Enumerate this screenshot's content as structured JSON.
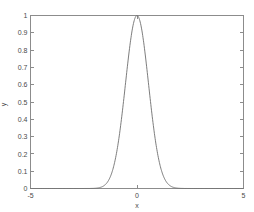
{
  "figure": {
    "background_color": "#ffffff",
    "axis_color": "#8c8c8c",
    "curve_color": "#6e6e6e",
    "text_color": "#4a4a4a"
  },
  "axes": {
    "x_title": "x",
    "y_title": "y",
    "x_tick_labels": [
      "-5",
      "0",
      "5"
    ],
    "y_tick_labels": [
      "0",
      "0.1",
      "0.2",
      "0.3",
      "0.4",
      "0.5",
      "0.6",
      "0.7",
      "0.8",
      "0.9",
      "1"
    ]
  },
  "chart_data": {
    "type": "line",
    "title": "",
    "xlabel": "x",
    "ylabel": "y",
    "xlim": [
      -5,
      5
    ],
    "ylim": [
      0,
      1
    ],
    "grid": false,
    "legend": null,
    "x_ticks": [
      -5,
      0,
      5
    ],
    "y_ticks": [
      0,
      0.1,
      0.2,
      0.3,
      0.4,
      0.5,
      0.6,
      0.7,
      0.8,
      0.9,
      1
    ],
    "y_minor_ticks": [
      0,
      0.1,
      0.2,
      0.3,
      0.4,
      0.5,
      0.6,
      0.7,
      0.8,
      0.9,
      1
    ],
    "series": [
      {
        "name": "gaussian",
        "function": "exp(-x^2 / (2*0.54^2))",
        "peak_x": 0,
        "peak_y": 1,
        "sigma": 0.54,
        "x": [
          -5,
          -4.75,
          -4.5,
          -4.25,
          -4,
          -3.75,
          -3.5,
          -3.25,
          -3,
          -2.75,
          -2.5,
          -2.25,
          -2,
          -1.9,
          -1.8,
          -1.7,
          -1.6,
          -1.5,
          -1.4,
          -1.3,
          -1.2,
          -1.1,
          -1,
          -0.9,
          -0.8,
          -0.7,
          -0.6,
          -0.5,
          -0.4,
          -0.3,
          -0.2,
          -0.1,
          0,
          0.1,
          0.2,
          0.3,
          0.4,
          0.5,
          0.6,
          0.7,
          0.8,
          0.9,
          1,
          1.1,
          1.2,
          1.3,
          1.4,
          1.5,
          1.6,
          1.7,
          1.8,
          1.9,
          2,
          2.25,
          2.5,
          2.75,
          3,
          3.25,
          3.5,
          3.75,
          4,
          4.25,
          4.5,
          4.75,
          5
        ],
        "y": [
          0,
          0,
          0,
          0,
          0,
          0,
          0,
          0,
          0,
          0,
          1.1e-05,
          0.000113,
          0.000942,
          0.002108,
          0.004477,
          0.009028,
          0.017278,
          0.031348,
          0.053907,
          0.087866,
          0.135686,
          0.198556,
          0.275437,
          0.362169,
          0.451795,
          0.535357,
          0.64118,
          0.745832,
          0.836318,
          0.91043,
          0.963404,
          0.992124,
          1,
          0.992124,
          0.963404,
          0.91043,
          0.836318,
          0.745832,
          0.64118,
          0.535357,
          0.451795,
          0.362169,
          0.275437,
          0.198556,
          0.135686,
          0.087866,
          0.053907,
          0.031348,
          0.017278,
          0.009028,
          0.004477,
          0.002108,
          0.000942,
          0.000113,
          1.1e-05,
          0,
          0,
          0,
          0,
          0,
          0,
          0,
          0,
          0,
          0
        ]
      }
    ]
  }
}
